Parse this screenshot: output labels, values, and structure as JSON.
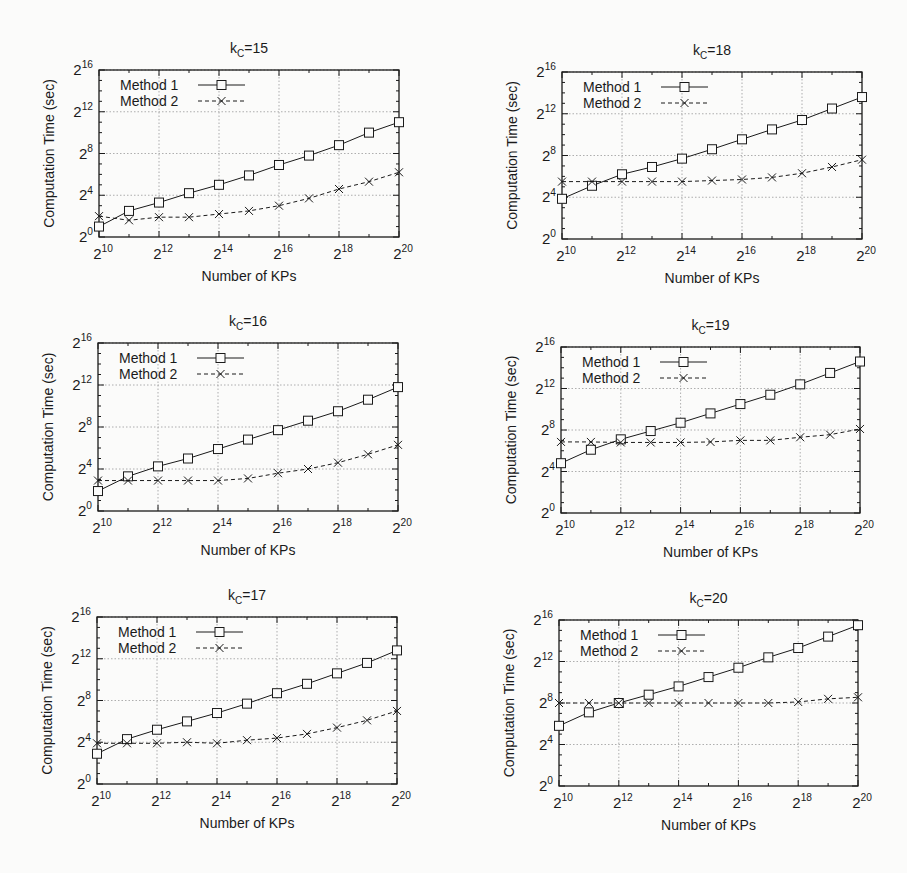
{
  "chart_data": [
    {
      "type": "line",
      "title": "k_C=15",
      "title_main": "k",
      "title_sub": "C",
      "title_rest": "=15",
      "xlabel": "Number of KPs",
      "ylabel": "Computation Time (sec)",
      "x_scale": "log2",
      "y_scale": "log2",
      "x_exponents": [
        10,
        11,
        12,
        13,
        14,
        15,
        16,
        17,
        18,
        19,
        20
      ],
      "x_ticks": [
        "2^10",
        "2^12",
        "2^14",
        "2^16",
        "2^18",
        "2^20"
      ],
      "y_ticks": [
        "2^0",
        "2^4",
        "2^8",
        "2^12",
        "2^16"
      ],
      "xlim": [
        10,
        20
      ],
      "ylim": [
        0,
        16
      ],
      "grid": true,
      "legend_position": "upper-left",
      "series": [
        {
          "name": "Method 1",
          "marker": "square",
          "line": "solid",
          "values_log2": [
            1.0,
            2.5,
            3.3,
            4.2,
            5.0,
            5.9,
            6.9,
            7.8,
            8.8,
            10.0,
            11.0
          ]
        },
        {
          "name": "Method 2",
          "marker": "x",
          "line": "dashed",
          "values_log2": [
            2.0,
            1.6,
            1.9,
            1.9,
            2.2,
            2.5,
            3.0,
            3.7,
            4.6,
            5.3,
            6.2
          ]
        }
      ]
    },
    {
      "type": "line",
      "title": "k_C=18",
      "title_main": "k",
      "title_sub": "C",
      "title_rest": "=18",
      "xlabel": "Number of KPs",
      "ylabel": "Computation Time (sec)",
      "x_scale": "log2",
      "y_scale": "log2",
      "x_exponents": [
        10,
        11,
        12,
        13,
        14,
        15,
        16,
        17,
        18,
        19,
        20
      ],
      "x_ticks": [
        "2^10",
        "2^12",
        "2^14",
        "2^16",
        "2^18",
        "2^20"
      ],
      "y_ticks": [
        "2^0",
        "2^4",
        "2^8",
        "2^12",
        "2^16"
      ],
      "xlim": [
        10,
        20
      ],
      "ylim": [
        0,
        16
      ],
      "grid": true,
      "legend_position": "upper-left",
      "series": [
        {
          "name": "Method 1",
          "marker": "square",
          "line": "solid",
          "values_log2": [
            3.85,
            5.1,
            6.2,
            6.9,
            7.7,
            8.6,
            9.55,
            10.5,
            11.4,
            12.5,
            13.6
          ]
        },
        {
          "name": "Method 2",
          "marker": "x",
          "line": "dashed",
          "values_log2": [
            5.5,
            5.5,
            5.5,
            5.5,
            5.5,
            5.6,
            5.7,
            5.9,
            6.3,
            6.9,
            7.6
          ]
        }
      ]
    },
    {
      "type": "line",
      "title": "k_C=16",
      "title_main": "k",
      "title_sub": "C",
      "title_rest": "=16",
      "xlabel": "Number of KPs",
      "ylabel": "Computation Time (sec)",
      "x_scale": "log2",
      "y_scale": "log2",
      "x_exponents": [
        10,
        11,
        12,
        13,
        14,
        15,
        16,
        17,
        18,
        19,
        20
      ],
      "x_ticks": [
        "2^10",
        "2^12",
        "2^14",
        "2^16",
        "2^18",
        "2^20"
      ],
      "y_ticks": [
        "2^0",
        "2^4",
        "2^8",
        "2^12",
        "2^16"
      ],
      "xlim": [
        10,
        20
      ],
      "ylim": [
        0,
        16
      ],
      "grid": true,
      "legend_position": "upper-left",
      "series": [
        {
          "name": "Method 1",
          "marker": "square",
          "line": "solid",
          "values_log2": [
            1.9,
            3.3,
            4.25,
            5.0,
            5.9,
            6.8,
            7.7,
            8.6,
            9.5,
            10.6,
            11.8
          ]
        },
        {
          "name": "Method 2",
          "marker": "x",
          "line": "dashed",
          "values_log2": [
            2.9,
            2.9,
            2.9,
            2.9,
            2.9,
            3.1,
            3.6,
            4.0,
            4.6,
            5.4,
            6.3
          ]
        }
      ]
    },
    {
      "type": "line",
      "title": "k_C=19",
      "title_main": "k",
      "title_sub": "C",
      "title_rest": "=19",
      "xlabel": "Number of KPs",
      "ylabel": "Computation Time (sec)",
      "x_scale": "log2",
      "y_scale": "log2",
      "x_exponents": [
        10,
        11,
        12,
        13,
        14,
        15,
        16,
        17,
        18,
        19,
        20
      ],
      "x_ticks": [
        "2^10",
        "2^12",
        "2^14",
        "2^16",
        "2^18",
        "2^20"
      ],
      "y_ticks": [
        "2^0",
        "2^4",
        "2^8",
        "2^12",
        "2^16"
      ],
      "xlim": [
        10,
        20
      ],
      "ylim": [
        0,
        16
      ],
      "grid": true,
      "legend_position": "upper-left",
      "series": [
        {
          "name": "Method 1",
          "marker": "square",
          "line": "solid",
          "values_log2": [
            4.8,
            6.1,
            7.1,
            7.9,
            8.7,
            9.6,
            10.5,
            11.4,
            12.4,
            13.5,
            14.6
          ]
        },
        {
          "name": "Method 2",
          "marker": "x",
          "line": "dashed",
          "values_log2": [
            6.85,
            6.85,
            6.8,
            6.8,
            6.8,
            6.85,
            7.0,
            7.0,
            7.3,
            7.55,
            8.1
          ]
        }
      ]
    },
    {
      "type": "line",
      "title": "k_C=17",
      "title_main": "k",
      "title_sub": "C",
      "title_rest": "=17",
      "xlabel": "Number of KPs",
      "ylabel": "Computation Time (sec)",
      "x_scale": "log2",
      "y_scale": "log2",
      "x_exponents": [
        10,
        11,
        12,
        13,
        14,
        15,
        16,
        17,
        18,
        19,
        20
      ],
      "x_ticks": [
        "2^10",
        "2^12",
        "2^14",
        "2^16",
        "2^18",
        "2^20"
      ],
      "y_ticks": [
        "2^0",
        "2^4",
        "2^8",
        "2^12",
        "2^16"
      ],
      "xlim": [
        10,
        20
      ],
      "ylim": [
        0,
        16
      ],
      "grid": true,
      "legend_position": "upper-left",
      "series": [
        {
          "name": "Method 1",
          "marker": "square",
          "line": "solid",
          "values_log2": [
            2.9,
            4.3,
            5.2,
            6.0,
            6.8,
            7.7,
            8.7,
            9.6,
            10.6,
            11.6,
            12.8
          ]
        },
        {
          "name": "Method 2",
          "marker": "x",
          "line": "dashed",
          "values_log2": [
            3.9,
            3.9,
            3.9,
            4.0,
            3.9,
            4.2,
            4.4,
            4.8,
            5.4,
            6.1,
            7.0
          ]
        }
      ]
    },
    {
      "type": "line",
      "title": "k_C=20",
      "title_main": "k",
      "title_sub": "C",
      "title_rest": "=20",
      "xlabel": "Number of KPs",
      "ylabel": "Computation Time (sec)",
      "x_scale": "log2",
      "y_scale": "log2",
      "x_exponents": [
        10,
        11,
        12,
        13,
        14,
        15,
        16,
        17,
        18,
        19,
        20
      ],
      "x_ticks": [
        "2^10",
        "2^12",
        "2^14",
        "2^16",
        "2^18",
        "2^20"
      ],
      "y_ticks": [
        "2^0",
        "2^4",
        "2^8",
        "2^12",
        "2^16"
      ],
      "xlim": [
        10,
        20
      ],
      "ylim": [
        0,
        16
      ],
      "grid": true,
      "legend_position": "upper-left",
      "series": [
        {
          "name": "Method 1",
          "marker": "square",
          "line": "solid",
          "values_log2": [
            5.8,
            7.1,
            8.0,
            8.8,
            9.6,
            10.5,
            11.4,
            12.4,
            13.3,
            14.4,
            15.5
          ]
        },
        {
          "name": "Method 2",
          "marker": "x",
          "line": "dashed",
          "values_log2": [
            8.0,
            8.0,
            8.0,
            8.0,
            8.0,
            8.0,
            8.0,
            8.0,
            8.1,
            8.4,
            8.55
          ]
        }
      ]
    }
  ],
  "style": {
    "background": "#fbfbfa",
    "ink": "#1a1a1a",
    "grid_color": "#9a9a9a"
  }
}
